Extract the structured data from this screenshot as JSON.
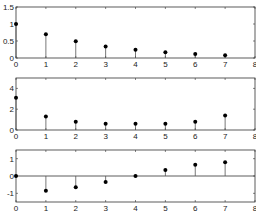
{
  "chart_data": [
    {
      "type": "stem",
      "title": "",
      "xlabel": "",
      "ylabel": "",
      "x": [
        0,
        1,
        2,
        3,
        4,
        5,
        6,
        7
      ],
      "values": [
        1.0,
        0.7,
        0.49,
        0.34,
        0.24,
        0.17,
        0.12,
        0.08
      ],
      "xlim": [
        0,
        8
      ],
      "ylim": [
        0,
        1.5
      ],
      "xticks": [
        "0",
        "1",
        "2",
        "3",
        "4",
        "5",
        "6",
        "7",
        "8"
      ],
      "yticks": [
        "0",
        "0.5",
        "1",
        "1.5"
      ],
      "ytick_values": [
        0,
        0.5,
        1,
        1.5
      ],
      "grid": false
    },
    {
      "type": "stem",
      "title": "",
      "xlabel": "",
      "ylabel": "",
      "x": [
        0,
        1,
        2,
        3,
        4,
        5,
        6,
        7
      ],
      "values": [
        3.1,
        1.3,
        0.8,
        0.6,
        0.6,
        0.6,
        0.8,
        1.4
      ],
      "xlim": [
        0,
        8
      ],
      "ylim": [
        0,
        5
      ],
      "xticks": [
        "0",
        "1",
        "2",
        "3",
        "4",
        "5",
        "6",
        "7",
        "8"
      ],
      "yticks": [
        "0",
        "2",
        "4"
      ],
      "ytick_values": [
        0,
        2,
        4
      ],
      "grid": false
    },
    {
      "type": "stem",
      "title": "",
      "xlabel": "",
      "ylabel": "",
      "x": [
        0,
        1,
        2,
        3,
        4,
        5,
        6,
        7
      ],
      "values": [
        0.0,
        -0.85,
        -0.65,
        -0.35,
        0.0,
        0.35,
        0.65,
        0.8
      ],
      "xlim": [
        0,
        8
      ],
      "ylim": [
        -1.5,
        1.5
      ],
      "xticks": [
        "0",
        "1",
        "2",
        "3",
        "4",
        "5",
        "6",
        "7",
        "8"
      ],
      "yticks": [
        "-1",
        "0",
        "1"
      ],
      "ytick_values": [
        -1,
        0,
        1
      ],
      "zero_line": true,
      "grid": false
    }
  ],
  "layout": {
    "panels": [
      {
        "top": 7,
        "bottom": 58
      },
      {
        "top": 78,
        "bottom": 130
      },
      {
        "top": 150,
        "bottom": 202
      }
    ],
    "left": 16,
    "right": 256,
    "line_color": "#555555",
    "marker_color": "#000000"
  }
}
